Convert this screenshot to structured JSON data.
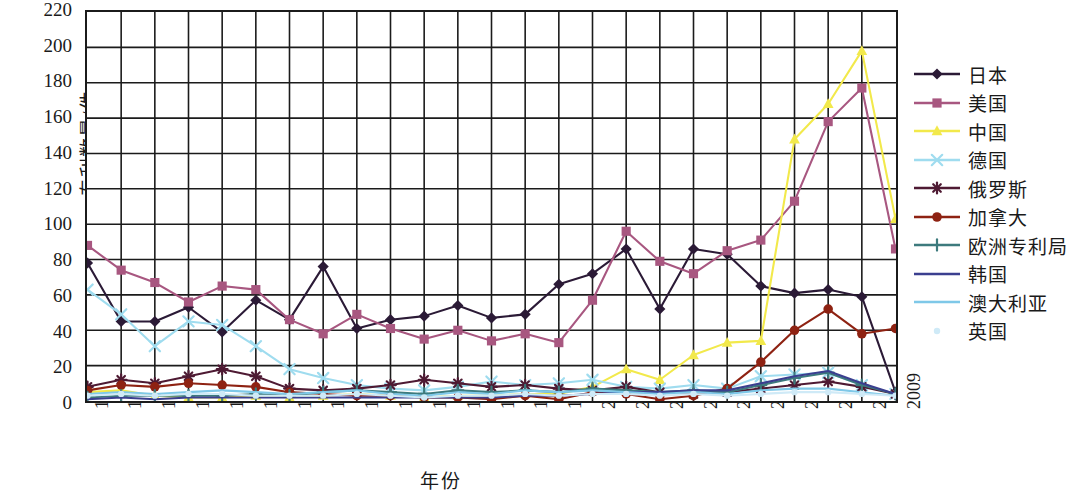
{
  "chart_data": {
    "type": "line",
    "title": "",
    "xlabel": "年份",
    "ylabel": "专利数量/件",
    "grid": true,
    "legend_position": "right",
    "xlim": [
      1985,
      2009
    ],
    "ylim": [
      0,
      220
    ],
    "ytick_step": 20,
    "yticks": [
      0,
      20,
      40,
      60,
      80,
      100,
      120,
      140,
      160,
      180,
      200,
      220
    ],
    "categories": [
      "1985",
      "1986",
      "1987",
      "1988",
      "1989",
      "1990",
      "1991",
      "1992",
      "1993",
      "1994",
      "1995",
      "1996",
      "1997",
      "1998",
      "1999",
      "2000",
      "2001",
      "2002",
      "2003",
      "2004",
      "2005",
      "2006",
      "2007",
      "2008",
      "2009"
    ],
    "series": [
      {
        "name": "日本",
        "color": "#2b1a36",
        "marker": "diamond",
        "values": [
          78,
          45,
          45,
          53,
          39,
          57,
          46,
          76,
          41,
          46,
          48,
          54,
          47,
          49,
          66,
          72,
          86,
          52,
          86,
          83,
          65,
          61,
          63,
          59,
          5
        ]
      },
      {
        "name": "美国",
        "color": "#a85780",
        "marker": "square",
        "values": [
          88,
          74,
          67,
          56,
          65,
          63,
          46,
          38,
          49,
          41,
          35,
          40,
          34,
          38,
          33,
          57,
          96,
          79,
          72,
          85,
          91,
          113,
          158,
          177,
          86
        ]
      },
      {
        "name": "中国",
        "color": "#f2e94b",
        "marker": "triangle",
        "values": [
          5,
          6,
          3,
          2,
          2,
          3,
          2,
          3,
          4,
          3,
          2,
          3,
          3,
          4,
          4,
          8,
          18,
          12,
          26,
          33,
          34,
          148,
          168,
          198,
          103
        ]
      },
      {
        "name": "德国",
        "color": "#9fdcef",
        "marker": "cross",
        "values": [
          63,
          49,
          31,
          45,
          43,
          31,
          18,
          13,
          9,
          7,
          6,
          8,
          11,
          9,
          10,
          12,
          8,
          7,
          9,
          7,
          14,
          15,
          16,
          9,
          4
        ]
      },
      {
        "name": "俄罗斯",
        "color": "#4e1a33",
        "marker": "asterisk",
        "values": [
          8,
          12,
          10,
          14,
          18,
          14,
          7,
          6,
          7,
          9,
          12,
          10,
          8,
          9,
          7,
          6,
          8,
          5,
          4,
          5,
          7,
          9,
          11,
          8,
          4
        ]
      },
      {
        "name": "加拿大",
        "color": "#8e2212",
        "marker": "circle",
        "values": [
          6,
          9,
          8,
          10,
          9,
          8,
          5,
          4,
          3,
          3,
          2,
          2,
          1,
          3,
          1,
          5,
          4,
          1,
          3,
          7,
          22,
          40,
          52,
          38,
          41
        ]
      },
      {
        "name": "欧洲专利局",
        "color": "#3d7a7d",
        "marker": "plus",
        "values": [
          2,
          3,
          3,
          3,
          3,
          4,
          3,
          5,
          6,
          5,
          4,
          6,
          5,
          6,
          5,
          7,
          6,
          5,
          6,
          5,
          9,
          13,
          16,
          9,
          4
        ]
      },
      {
        "name": "韩国",
        "color": "#3b3f8f",
        "marker": "line",
        "values": [
          1,
          2,
          1,
          2,
          2,
          2,
          2,
          2,
          2,
          2,
          2,
          2,
          2,
          3,
          3,
          4,
          5,
          5,
          6,
          6,
          10,
          14,
          17,
          10,
          4
        ]
      },
      {
        "name": "澳大利亚",
        "color": "#7ec8e8",
        "marker": "line",
        "values": [
          4,
          5,
          4,
          5,
          6,
          5,
          4,
          5,
          6,
          4,
          3,
          5,
          4,
          6,
          5,
          6,
          5,
          4,
          5,
          4,
          6,
          7,
          7,
          5,
          3
        ]
      },
      {
        "name": "英国",
        "color": "#cfeaf7",
        "marker": "dot",
        "values": [
          3,
          4,
          3,
          4,
          4,
          3,
          3,
          3,
          4,
          3,
          2,
          3,
          3,
          4,
          3,
          4,
          4,
          3,
          4,
          3,
          4,
          5,
          5,
          4,
          3
        ]
      }
    ]
  }
}
